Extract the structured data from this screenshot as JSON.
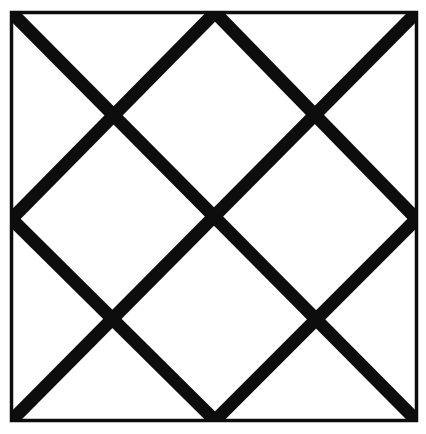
{
  "figure": {
    "title": "Diagonal lattice inscribed in a square",
    "canvas": {
      "width": 426,
      "height": 434,
      "background_color": "#ffffff"
    },
    "ink_color": "#0d0d0d",
    "frame": {
      "name": "outer-square",
      "left": 11.5,
      "top": 12.5,
      "right": 416.5,
      "bottom": 420.5,
      "width": 405,
      "height": 408,
      "stroke_width": 3.5,
      "stroke_color": "#0d0d0d",
      "fill": "none"
    },
    "midpoints": {
      "top": {
        "x": 215,
        "y": 12.5
      },
      "bottom": {
        "x": 215,
        "y": 420.5
      },
      "left": {
        "x": 11.5,
        "y": 219
      },
      "right": {
        "x": 416.5,
        "y": 219
      },
      "center": {
        "x": 215,
        "y": 219
      }
    },
    "crossings": [
      {
        "name": "crossing-top-left",
        "x": 120,
        "y": 120
      },
      {
        "name": "crossing-top-right",
        "x": 312,
        "y": 120
      },
      {
        "name": "crossing-center",
        "x": 215,
        "y": 218
      },
      {
        "name": "crossing-bottom-left",
        "x": 120,
        "y": 316
      },
      {
        "name": "crossing-bottom-right",
        "x": 312,
        "y": 316
      }
    ],
    "diagonals": {
      "stroke_width": 13,
      "stroke_color": "#0d0d0d",
      "angle_degrees": 45,
      "count": 6,
      "lines": [
        {
          "name": "diagonal-main-tl-br",
          "direction": "down-right",
          "x1": 11.5,
          "y1": 12.5,
          "x2": 416.5,
          "y2": 420.5
        },
        {
          "name": "diagonal-main-tr-bl",
          "direction": "down-left",
          "x1": 416.5,
          "y1": 12.5,
          "x2": 11.5,
          "y2": 420.5
        },
        {
          "name": "diagonal-topmid-to-rightmid",
          "direction": "down-right",
          "x1": 215,
          "y1": 12.5,
          "x2": 416.5,
          "y2": 219
        },
        {
          "name": "diagonal-leftmid-to-bottommid",
          "direction": "down-right",
          "x1": 11.5,
          "y1": 219,
          "x2": 215,
          "y2": 420.5
        },
        {
          "name": "diagonal-topmid-to-leftmid",
          "direction": "down-left",
          "x1": 215,
          "y1": 12.5,
          "x2": 11.5,
          "y2": 219
        },
        {
          "name": "diagonal-rightmid-to-bottommid",
          "direction": "down-left",
          "x1": 416.5,
          "y1": 219,
          "x2": 215,
          "y2": 420.5
        }
      ]
    },
    "regions": {
      "central_diamond": "One large diamond centered in the square with vertices at the four edge midpoints of the inner diagonal grid",
      "edge_half_diamonds": 4,
      "corner_triangles": 4
    }
  }
}
